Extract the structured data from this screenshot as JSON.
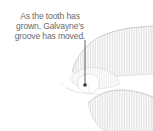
{
  "figure": {
    "width": 153,
    "height": 131,
    "background_color": "#ffffff"
  },
  "caption": {
    "full_text": "As the tooth has grown, Galvayne's groove has moved.",
    "lines": [
      "As the tooth has",
      "grown, Galvayne's",
      "groove has moved."
    ],
    "text_color": "#6b6b6b",
    "align": "center"
  },
  "leader": {
    "label": "leader-line",
    "color": "#4d4d4d",
    "x": 85,
    "y_start": 40,
    "y_end": 85,
    "dot_radius": 1.8
  },
  "artwork": {
    "label": "hand-holding-tooth-line-drawing",
    "style": "vertical-hatching",
    "hatch_color": "#d8d8d8",
    "outline_color": "#cfcfcf",
    "shapes": [
      "upper-hand-back",
      "thumb",
      "index-finger",
      "tooth",
      "lower-fingers"
    ]
  }
}
